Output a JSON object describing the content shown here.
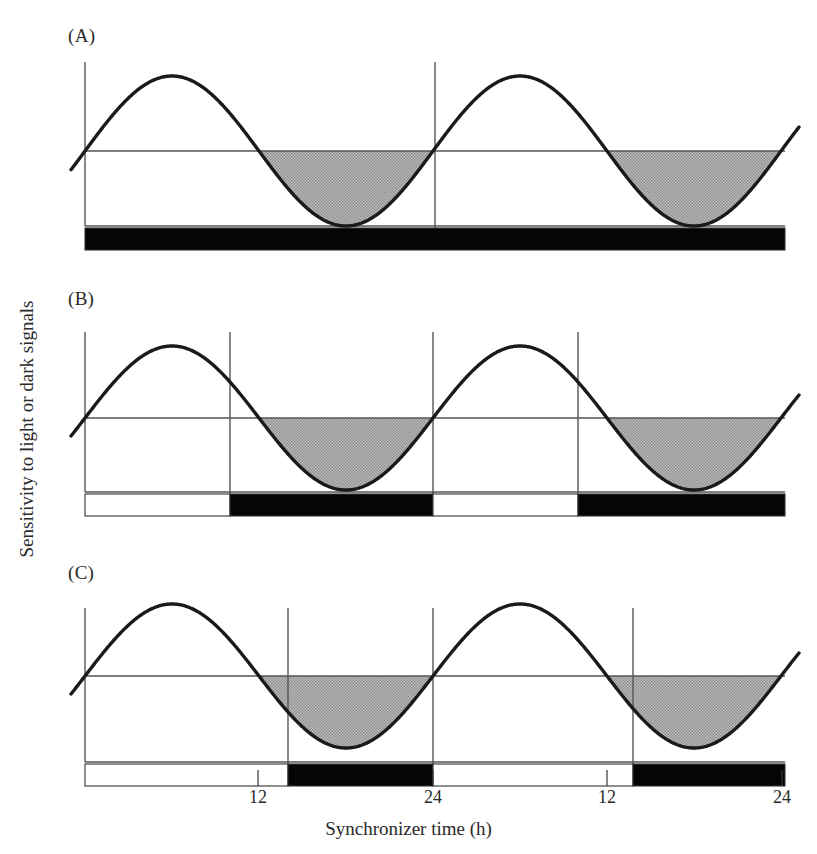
{
  "figure": {
    "axis": {
      "ylabel": "Sensitivity to light or dark signals",
      "xlabel": "Synchronizer time (h)",
      "xticks": [
        {
          "label": "12",
          "x": 258
        },
        {
          "label": "24",
          "x": 433
        },
        {
          "label": "12",
          "x": 607
        },
        {
          "label": "24",
          "x": 782
        }
      ]
    },
    "panels": [
      {
        "id": "A",
        "label": "(A)",
        "label_x": 68,
        "label_y": 25,
        "condition": "constant darkness",
        "plot": {
          "left": 85,
          "right": 785,
          "top": 62,
          "baseline": 151,
          "bottom": 226
        },
        "curve": {
          "amplitude": 75,
          "period": 348,
          "phase_x": 85,
          "start_value": 0,
          "direction": "rising"
        },
        "vlines": [
          435
        ],
        "bar": {
          "top": 228,
          "height": 22,
          "segments": [
            {
              "from": 85,
              "to": 785,
              "fill": "dark"
            }
          ]
        }
      },
      {
        "id": "B",
        "label": "(B)",
        "label_x": 68,
        "label_y": 288,
        "condition": "entrained light-dark cycle 12:12",
        "plot": {
          "left": 85,
          "right": 785,
          "top": 332,
          "baseline": 418,
          "bottom": 492
        },
        "curve": {
          "amplitude": 72,
          "period": 348,
          "phase_x": 85,
          "start_value": 0,
          "direction": "rising"
        },
        "vlines": [
          230,
          433,
          578
        ],
        "bar": {
          "top": 494,
          "height": 22,
          "segments": [
            {
              "from": 85,
              "to": 230,
              "fill": "light"
            },
            {
              "from": 230,
              "to": 433,
              "fill": "dark"
            },
            {
              "from": 433,
              "to": 578,
              "fill": "light"
            },
            {
              "from": 578,
              "to": 785,
              "fill": "dark"
            }
          ]
        }
      },
      {
        "id": "C",
        "label": "(C)",
        "label_x": 68,
        "label_y": 562,
        "condition": "phase-delayed light-dark cycle",
        "plot": {
          "left": 85,
          "right": 785,
          "top": 608,
          "baseline": 676,
          "bottom": 762
        },
        "curve": {
          "amplitude": 72,
          "period": 348,
          "phase_x": 85,
          "start_value": 0,
          "direction": "rising"
        },
        "vlines": [
          288,
          433,
          633
        ],
        "bar": {
          "top": 764,
          "height": 22,
          "segments": [
            {
              "from": 85,
              "to": 288,
              "fill": "light"
            },
            {
              "from": 288,
              "to": 433,
              "fill": "dark"
            },
            {
              "from": 433,
              "to": 633,
              "fill": "light"
            },
            {
              "from": 633,
              "to": 785,
              "fill": "dark"
            }
          ]
        }
      }
    ],
    "colors": {
      "curve": "#1a1a1a",
      "axis": "#555555",
      "shade": "#a9a9a9",
      "dark_bar": "#050505",
      "light_bar": "#ffffff",
      "bar_border": "#333333"
    }
  },
  "chart_data": {
    "type": "line",
    "title": "Sensitivity to light or dark signals",
    "xlabel": "Synchronizer time (h)",
    "ylabel": "Sensitivity to light or dark signals",
    "x_tick_labels": [
      "12",
      "24",
      "12",
      "24"
    ],
    "x_tick_hours": [
      12,
      24,
      36,
      48
    ],
    "xlim": [
      0,
      48
    ],
    "series": [
      {
        "name": "(A) constant darkness",
        "form": "sine",
        "period_hours": 24,
        "phase_hours": 0,
        "amplitude": 1
      },
      {
        "name": "(B) entrained LD 12:12",
        "form": "sine",
        "period_hours": 24,
        "phase_hours": 0,
        "amplitude": 1
      },
      {
        "name": "(C) phase-delayed LD",
        "form": "sine",
        "period_hours": 24,
        "phase_hours": 0,
        "amplitude": 1
      }
    ],
    "shaded_region": "negative half-cycle (below baseline)",
    "grid": false,
    "legend": "none"
  }
}
